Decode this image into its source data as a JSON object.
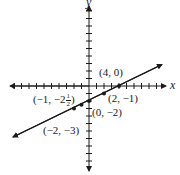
{
  "chart_data": {
    "type": "line",
    "title": "",
    "xlabel": "x",
    "ylabel": "y",
    "xlim": [
      -10,
      10
    ],
    "ylim": [
      -11,
      11
    ],
    "grid": false,
    "tick_spacing": 1,
    "line": {
      "equation": "y = (1/2)x - 2",
      "slope": 0.5,
      "intercept": -2,
      "x_range": [
        -10,
        9.5
      ]
    },
    "points": [
      {
        "x": 4,
        "y": 0,
        "label": "(4, 0)"
      },
      {
        "x": 2,
        "y": -1,
        "label": "(2, −1)"
      },
      {
        "x": 0,
        "y": -2,
        "label": "(0, −2)"
      },
      {
        "x": -1,
        "y": -2.5,
        "label": "(−1, −2½)"
      },
      {
        "x": -2,
        "y": -3,
        "label": "(−2, −3)"
      }
    ]
  },
  "labels": {
    "x_axis": "x",
    "y_axis": "y",
    "p1": "(4, 0)",
    "p2": "(2, −1)",
    "p3": "(0, −2)",
    "p4_main": "(−1, −2",
    "p4_num": "1",
    "p4_den": "2",
    "p4_close": ")",
    "p5": "(−2, −3)"
  },
  "colors": {
    "ink": "#1a1a1a",
    "background": "#ffffff"
  }
}
